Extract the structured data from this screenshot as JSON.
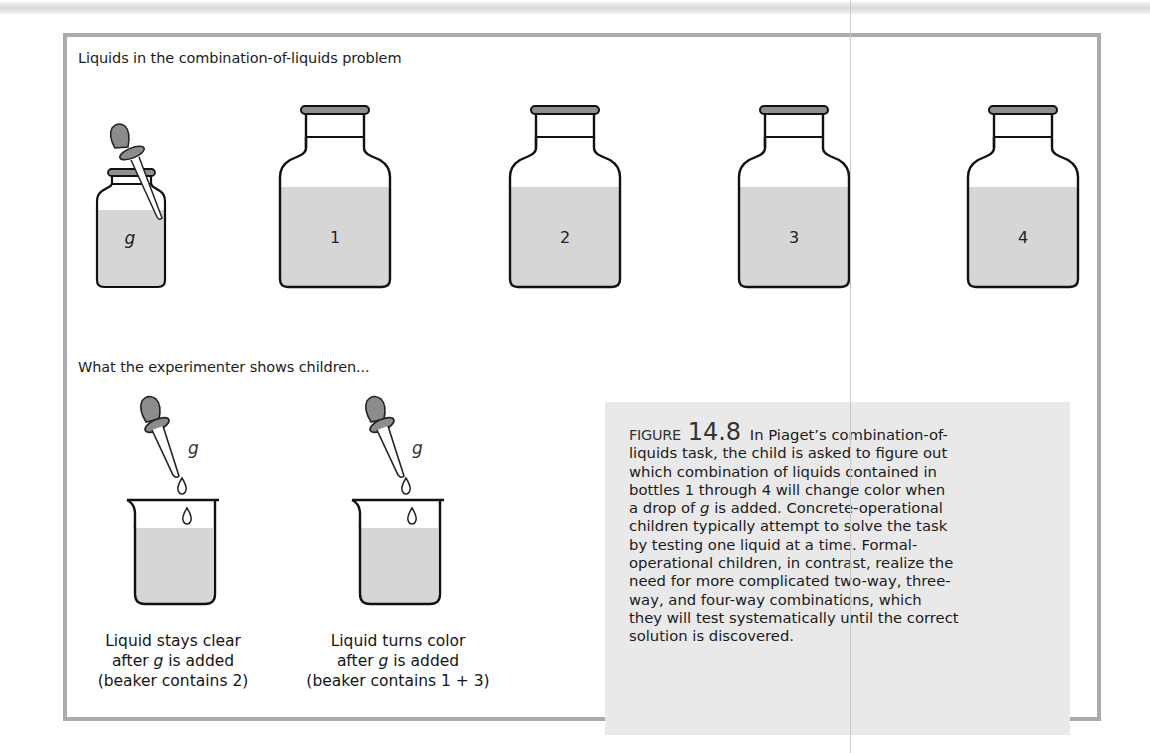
{
  "figure": {
    "section_heading_top": "Liquids in the combination-of-liquids problem",
    "section_heading_bottom": "What the experimenter shows children...",
    "bottles": [
      {
        "id": "g",
        "label": "g",
        "type": "small-with-dropper",
        "italic": true
      },
      {
        "id": "1",
        "label": "1",
        "type": "large"
      },
      {
        "id": "2",
        "label": "2",
        "type": "large"
      },
      {
        "id": "3",
        "label": "3",
        "type": "large"
      },
      {
        "id": "4",
        "label": "4",
        "type": "large"
      }
    ],
    "demonstrations": [
      {
        "dropper_label": "g",
        "caption_line1": "Liquid stays clear",
        "caption_line2_pre": "after ",
        "caption_line2_var": "g",
        "caption_line2_post": " is added",
        "caption_line3": "(beaker contains 2)"
      },
      {
        "dropper_label": "g",
        "caption_line1": "Liquid turns color",
        "caption_line2_pre": "after ",
        "caption_line2_var": "g",
        "caption_line2_post": " is added",
        "caption_line3": "(beaker contains 1 + 3)"
      }
    ],
    "caption": {
      "figure_word": "FIGURE",
      "figure_number": "14.8",
      "lines": [
        {
          "pre": "In Piaget’s combination-of-"
        },
        {
          "pre": "liquids task, the child is asked to figure out"
        },
        {
          "pre": "which combination of liquids contained in"
        },
        {
          "pre": "bottles 1 through 4 will change color when"
        },
        {
          "pre": "a drop of ",
          "var": "g",
          "post": " is added. Concrete-operational"
        },
        {
          "pre": "children typically attempt to solve the task"
        },
        {
          "pre": "by testing one liquid at a time. Formal-"
        },
        {
          "pre": "operational children, in contrast, realize the"
        },
        {
          "pre": "need for more complicated two-way, three-"
        },
        {
          "pre": "way, and four-way combinations, which"
        },
        {
          "pre": "they will test systematically until the correct"
        },
        {
          "pre": "solution is discovered."
        }
      ]
    },
    "colors": {
      "liquid_fill": "#d6d6d6",
      "cap_fill": "#8f8f8f",
      "bulb_fill": "#8c8c8c",
      "frame_border": "#ababab",
      "caption_bg": "#e9e9e9",
      "outline": "#111111"
    }
  }
}
